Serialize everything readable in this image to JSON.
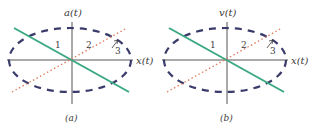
{
  "panels": [
    {
      "id": "a",
      "y_axis_label": "a(t)",
      "x_axis_label": "x(t)",
      "caption": "(a)",
      "region_labels": [
        "1",
        "2",
        "3"
      ]
    },
    {
      "id": "b",
      "y_axis_label": "v(t)",
      "x_axis_label": "x(t)",
      "caption": "(b)",
      "region_labels": [
        "1",
        "2",
        "3"
      ]
    }
  ],
  "colors": {
    "axis": "#555555",
    "ellipse": "#3b3b6b",
    "solid_line": "#3aa882",
    "dotted_line": "#e07a5a",
    "text": "#3a3a3a"
  }
}
